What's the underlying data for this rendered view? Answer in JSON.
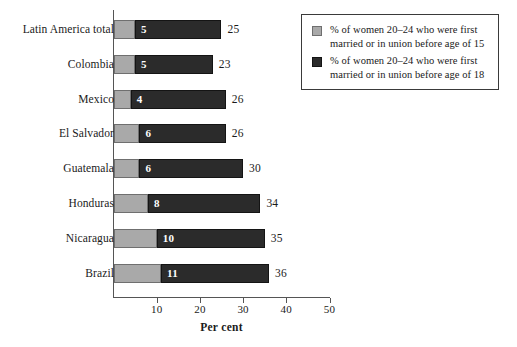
{
  "chart_data": {
    "type": "bar",
    "orientation": "horizontal",
    "stacked": true,
    "title": "",
    "xlabel": "Per cent",
    "ylabel": "",
    "xlim": [
      0,
      50
    ],
    "xticks": [
      0,
      10,
      20,
      30,
      40,
      50
    ],
    "xtick_labels": [
      "",
      "10",
      "20",
      "30",
      "40",
      "50"
    ],
    "grid": false,
    "legend_position": "top-right",
    "categories": [
      "Latin America total",
      "Colombia",
      "Mexico",
      "El Salvador",
      "Guatemala",
      "Honduras",
      "Nicaragua",
      "Brazil"
    ],
    "series": [
      {
        "name": "% of women 20–24 who were first married or in union before age of 15",
        "color": "#a9a9a9",
        "values": [
          5,
          5,
          4,
          6,
          6,
          8,
          10,
          11
        ]
      },
      {
        "name": "% of women 20–24 who were first married or in union before age of 18",
        "color": "#2b2b2b",
        "values": [
          25,
          23,
          26,
          26,
          30,
          34,
          35,
          36
        ]
      }
    ],
    "inner_labels": [
      "5",
      "5",
      "4",
      "6",
      "6",
      "8",
      "10",
      "11"
    ],
    "end_labels": [
      "25",
      "23",
      "26",
      "26",
      "30",
      "34",
      "35",
      "36"
    ]
  },
  "legend": {
    "entries": [
      {
        "swatch": "light",
        "line1": "% of women 20–24 who were first",
        "line2": "married or in union before age of 15"
      },
      {
        "swatch": "dark",
        "line1": "% of women 20–24 who were first",
        "line2": "married or in union before age of 18"
      }
    ]
  },
  "axis": {
    "title": "Per cent",
    "ticks": [
      "10",
      "20",
      "30",
      "40",
      "50"
    ]
  }
}
